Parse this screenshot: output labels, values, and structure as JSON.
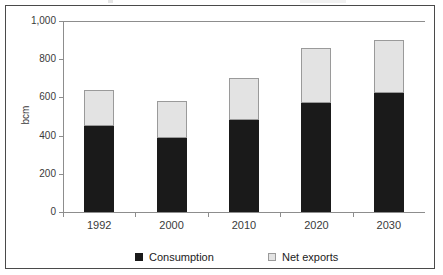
{
  "chart_data": {
    "type": "bar",
    "stacked": true,
    "title": "",
    "xlabel": "",
    "ylabel": "bcm",
    "ylim": [
      0,
      1000
    ],
    "yticks": [
      0,
      200,
      400,
      600,
      800,
      1000
    ],
    "ytick_labels": [
      "0",
      "200",
      "400",
      "600",
      "800",
      "1,000"
    ],
    "categories": [
      "1992",
      "2000",
      "2010",
      "2020",
      "2030"
    ],
    "grid": false,
    "legend_position": "bottom",
    "series": [
      {
        "name": "Consumption",
        "color": "#1a1a1a",
        "values": [
          450,
          390,
          480,
          570,
          625
        ]
      },
      {
        "name": "Net exports",
        "color": "#e3e3e3",
        "values": [
          190,
          190,
          220,
          290,
          275
        ]
      }
    ],
    "totals": [
      640,
      580,
      700,
      860,
      900
    ]
  },
  "legend": {
    "items": [
      {
        "label": "Consumption",
        "swatch": "dark-square-icon"
      },
      {
        "label": "Net exports",
        "swatch": "light-square-icon"
      }
    ]
  },
  "colors": {
    "consumption": "#1a1a1a",
    "net_exports": "#e3e3e3",
    "axis": "#8d8d8d",
    "frame": "#4a4a4a",
    "text": "#3a3a3a",
    "background": "#ffffff"
  }
}
